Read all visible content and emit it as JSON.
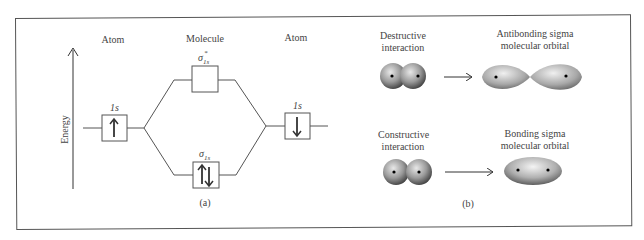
{
  "panel_a": {
    "caption": "(a)",
    "axis_label": "Energy",
    "left_header": "Atom",
    "center_header": "Molecule",
    "right_header": "Atom",
    "left_orbital": {
      "label": "1s",
      "electrons": "↑"
    },
    "right_orbital": {
      "label": "1s",
      "electrons": "↓"
    },
    "antibonding_orbital": {
      "label": "σ*1s",
      "symbol": "σ",
      "star": "*",
      "subscript": "1s",
      "electrons": ""
    },
    "bonding_orbital": {
      "label": "σ1s",
      "symbol": "σ",
      "subscript": "1s",
      "electrons": "↑↓"
    }
  },
  "panel_b": {
    "caption": "(b)",
    "top": {
      "left_label_line1": "Destructive",
      "left_label_line2": "interaction",
      "right_label_line1": "Antibonding sigma",
      "right_label_line2": "molecular orbital"
    },
    "bottom": {
      "left_label_line1": "Constructive",
      "left_label_line2": "interaction",
      "right_label_line1": "Bonding sigma",
      "right_label_line2": "molecular orbital"
    }
  },
  "colors": {
    "line": "#555555",
    "orbital_light": "#e6e6e6",
    "orbital_dark": "#3a3a3a",
    "nucleus": "#000000"
  }
}
